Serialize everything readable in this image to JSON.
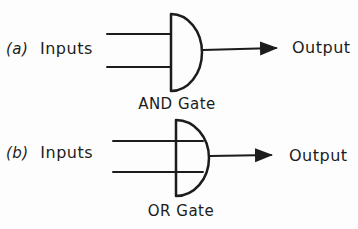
{
  "colors": {
    "ink": "#1c1c1c",
    "background": "#fdfdfd"
  },
  "figures": [
    {
      "index_label": "(a)",
      "inputs_label": "Inputs",
      "output_label": "Output",
      "caption": "AND Gate",
      "gate_type": "AND",
      "num_inputs": 2
    },
    {
      "index_label": "(b)",
      "inputs_label": "Inputs",
      "output_label": "Output",
      "caption": "OR Gate",
      "gate_type": "OR",
      "num_inputs": 2
    }
  ]
}
